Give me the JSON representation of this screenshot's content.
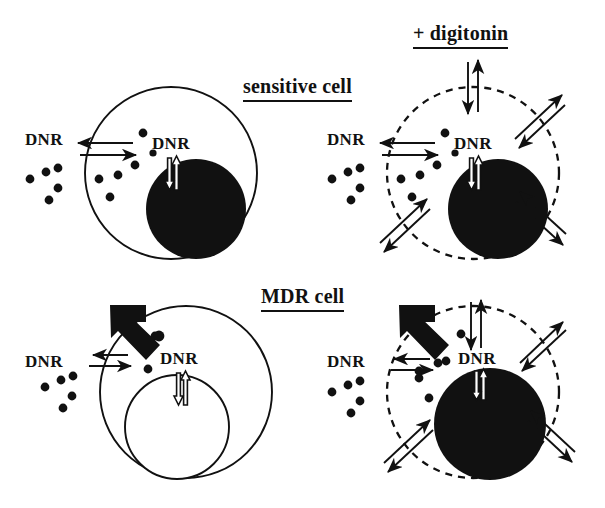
{
  "figure": {
    "kind": "cell-biology-schematic",
    "background_color": "#ffffff",
    "ink_color": "#111111"
  },
  "headings": {
    "digitonin": "+ digitonin",
    "sensitive_cell": "sensitive cell",
    "mdr_cell": "MDR cell"
  },
  "labels": {
    "dnr": "DNR",
    "nucleus": "nucleus"
  },
  "panels": [
    {
      "id": "sensitive-untreated",
      "row": "sensitive cell",
      "column": "untreated",
      "membrane_style": "solid",
      "nucleus_style": "filled-black",
      "nucleus_label": "",
      "has_mdr_pump": false,
      "has_digitonin_pores": false,
      "extracellular_dnr_dots": 5,
      "intracellular_dnr_dots": 6,
      "outer_label": "DNR",
      "inner_label": "DNR",
      "influx_arrow": "long-right",
      "efflux_arrow": "short-left",
      "nuclear_arrow": "hollow-double-vertical"
    },
    {
      "id": "sensitive-digitonin",
      "row": "sensitive cell",
      "column": "+ digitonin",
      "membrane_style": "dashed",
      "nucleus_style": "filled-black",
      "nucleus_label": "",
      "has_mdr_pump": false,
      "has_digitonin_pores": true,
      "extracellular_dnr_dots": 5,
      "intracellular_dnr_dots": 6,
      "outer_label": "DNR",
      "inner_label": "DNR",
      "influx_arrow": "long-right",
      "efflux_arrow": "short-left",
      "nuclear_arrow": "hollow-double-vertical",
      "pore_arrows": 4
    },
    {
      "id": "mdr-untreated",
      "row": "MDR cell",
      "column": "untreated",
      "membrane_style": "solid",
      "nucleus_style": "open-white",
      "nucleus_label": "nucleus",
      "has_mdr_pump": true,
      "has_digitonin_pores": false,
      "extracellular_dnr_dots": 5,
      "intracellular_dnr_dots": 2,
      "outer_label": "DNR",
      "inner_label": "DNR",
      "influx_arrow": "long-right",
      "efflux_arrow": "short-left",
      "nuclear_arrow": "hollow-double-vertical"
    },
    {
      "id": "mdr-digitonin",
      "row": "MDR cell",
      "column": "+ digitonin",
      "membrane_style": "dashed",
      "nucleus_style": "filled-black",
      "nucleus_label": "",
      "has_mdr_pump": true,
      "has_digitonin_pores": true,
      "extracellular_dnr_dots": 5,
      "intracellular_dnr_dots": 6,
      "outer_label": "DNR",
      "inner_label": "DNR",
      "influx_arrow": "long-right",
      "efflux_arrow": "short-left",
      "nuclear_arrow": "hollow-double-vertical",
      "pore_arrows": 4
    }
  ],
  "legend_semantics": {
    "black_elbow_arrow": "MDR efflux pump expelling DNR",
    "dashed_circle": "digitonin-permeabilized plasma membrane",
    "black_disc": "DNR-loaded nucleus",
    "white_disc": "DNR-free nucleus",
    "small_dot": "DNR molecule"
  }
}
